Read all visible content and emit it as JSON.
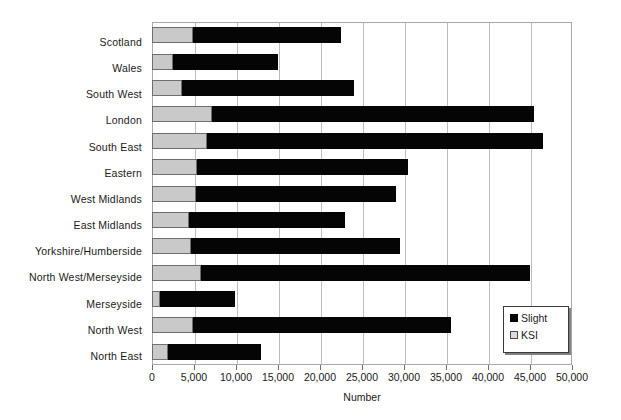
{
  "chart_data": {
    "type": "bar",
    "orientation": "horizontal",
    "stacked": true,
    "title": "",
    "xlabel": "Number",
    "ylabel": "",
    "xlim": [
      0,
      50000
    ],
    "xticks": [
      "0",
      "5,000",
      "10,000",
      "15,000",
      "20,000",
      "25,000",
      "30,000",
      "35,000",
      "40,000",
      "45,000",
      "50,000"
    ],
    "xtick_values": [
      0,
      5000,
      10000,
      15000,
      20000,
      25000,
      30000,
      35000,
      40000,
      45000,
      50000
    ],
    "grid": "vertical",
    "legend_position": "bottom-right",
    "categories": [
      "Scotland",
      "Wales",
      "South West",
      "London",
      "South East",
      "Eastern",
      "West Midlands",
      "East Midlands",
      "Yorkshire/Humberside",
      "North West/Merseyside",
      "Merseyside",
      "North West",
      "North East"
    ],
    "series": [
      {
        "name": "KSI",
        "color": "#c9c9c9",
        "values": [
          4900,
          2500,
          3600,
          7100,
          6600,
          5300,
          5200,
          4400,
          4600,
          5800,
          1000,
          4900,
          1900
        ]
      },
      {
        "name": "Slight",
        "color": "#050505",
        "values": [
          17600,
          12500,
          20400,
          38400,
          40000,
          25200,
          23800,
          18600,
          24900,
          39200,
          8900,
          30700,
          11100
        ]
      }
    ],
    "totals": [
      22500,
      15000,
      24000,
      45500,
      46600,
      30500,
      29000,
      23000,
      29500,
      45000,
      9900,
      35600,
      13000
    ]
  },
  "legend": {
    "items": [
      {
        "label": "Slight",
        "swatch": "black-square-icon"
      },
      {
        "label": "KSI",
        "swatch": "light-gray-square-icon"
      }
    ]
  }
}
